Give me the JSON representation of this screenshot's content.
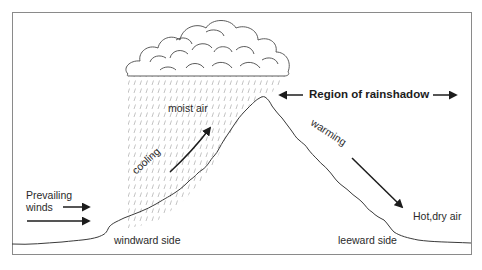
{
  "diagram": {
    "type": "rain-shadow-orographic-diagram",
    "labels": {
      "moist_air": "moist air",
      "cooling": "cooling",
      "prevailing_winds_line1": "Prevailing",
      "prevailing_winds_line2": "winds",
      "windward_side": "windward side",
      "region_of_rainshadow": "Region of rainshadow",
      "warming": "warming",
      "hot_dry_air": "Hot,dry air",
      "leeward_side": "leeward side"
    },
    "elements": {
      "frame": "border-frame",
      "cloud": "cloud-icon",
      "rain": "rain-hatching",
      "mountain": "mountain-profile",
      "wind_arrows": 2,
      "rising_air_arrow": "arrow-up-right",
      "descending_air_arrow": "arrow-down-right",
      "rainshadow_arrows": "double-arrow-horizontal"
    },
    "colors": {
      "line": "#3a3a3a",
      "frame": "#8a8a8a",
      "rain": "#9a9a9a",
      "text": "#2a2a2a",
      "background": "#ffffff"
    }
  }
}
